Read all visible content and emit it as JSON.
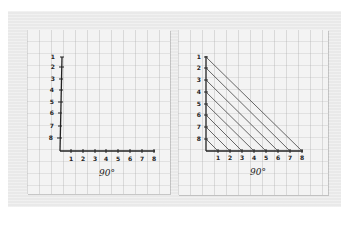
{
  "scene": {
    "description": "Photo of two sheets of graph paper with hand-drawn axes for string-art curve construction",
    "background_color": "#e9e9e9",
    "paper_color": "#f3f3f3",
    "ink_color": "#222222"
  },
  "left_sheet": {
    "angle_label": "90°",
    "y_axis_labels": [
      "1",
      "2",
      "3",
      "4",
      "5",
      "6",
      "7",
      "8"
    ],
    "x_axis_labels": [
      "1",
      "2",
      "3",
      "4",
      "5",
      "6",
      "7",
      "8"
    ],
    "lines_drawn": 0
  },
  "right_sheet": {
    "angle_label": "90°",
    "y_axis_labels": [
      "1",
      "2",
      "3",
      "4",
      "5",
      "6",
      "7",
      "8"
    ],
    "x_axis_labels": [
      "1",
      "2",
      "3",
      "4",
      "5",
      "6",
      "7",
      "8"
    ],
    "lines_drawn": 8,
    "connections": [
      {
        "from_y": "1",
        "to_x": "8"
      },
      {
        "from_y": "2",
        "to_x": "7"
      },
      {
        "from_y": "3",
        "to_x": "6"
      },
      {
        "from_y": "4",
        "to_x": "5"
      },
      {
        "from_y": "5",
        "to_x": "4"
      },
      {
        "from_y": "6",
        "to_x": "3"
      },
      {
        "from_y": "7",
        "to_x": "2"
      },
      {
        "from_y": "8",
        "to_x": "1"
      }
    ]
  }
}
